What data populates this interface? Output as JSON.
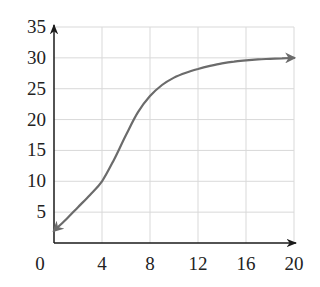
{
  "chart_data": {
    "type": "line",
    "title": "",
    "xlabel": "",
    "ylabel": "",
    "xlim": [
      0,
      20
    ],
    "ylim": [
      0,
      35
    ],
    "grid": true,
    "legend": null,
    "x_ticks": [
      0,
      4,
      8,
      12,
      16,
      20
    ],
    "y_ticks": [
      5,
      10,
      15,
      20,
      25,
      30,
      35
    ],
    "x_tick_labels": [
      "0",
      "4",
      "8",
      "12",
      "16",
      "20"
    ],
    "y_tick_labels": [
      "5",
      "10",
      "15",
      "20",
      "25",
      "30",
      "35"
    ],
    "series": [
      {
        "name": "logistic curve",
        "x": [
          0,
          1,
          2,
          3,
          4,
          5,
          6,
          7,
          8,
          9,
          10,
          11,
          12,
          13,
          14,
          15,
          16,
          17,
          18,
          19,
          20
        ],
        "values": [
          2,
          3.8,
          5.8,
          7.8,
          10,
          13.5,
          17.5,
          21.2,
          23.8,
          25.6,
          26.8,
          27.6,
          28.2,
          28.7,
          29.1,
          29.4,
          29.6,
          29.75,
          29.85,
          29.92,
          30
        ],
        "arrow_start": true,
        "arrow_end": true
      }
    ],
    "annotations": []
  },
  "colors": {
    "curve": "#6b6b6b",
    "axis": "#1a1a1a",
    "grid": "#d9d9d9"
  }
}
